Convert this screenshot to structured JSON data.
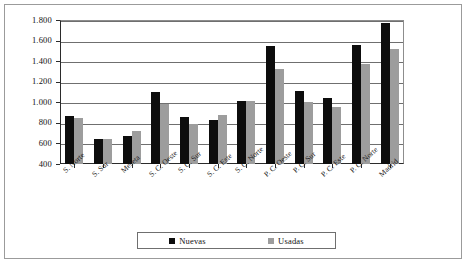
{
  "chart_data": {
    "type": "bar",
    "title": "",
    "subtitle": "",
    "xlabel": "",
    "ylabel": "",
    "ylim": [
      400,
      1800
    ],
    "ytick_step": 200,
    "ytick_labels": [
      "1.800",
      "1.600",
      "1.400",
      "1.200",
      "1.000",
      "800",
      "600",
      "400"
    ],
    "ytick_values": [
      1800,
      1600,
      1400,
      1200,
      1000,
      800,
      600,
      400
    ],
    "grid": true,
    "legend_position": "bottom",
    "categories": [
      "S. Norte",
      "S. Sur",
      "Meseta",
      "S. C. Oeste",
      "S. C. Sur",
      "S. C. Este",
      "S. C. Norte",
      "P. C. Oeste",
      "P. C. Sur",
      "P. C. Este",
      "P. C. Norte",
      "Madrid"
    ],
    "series": [
      {
        "name": "Nuevas",
        "color": "#0d0d0d",
        "values": [
          870,
          640,
          675,
          1105,
          855,
          825,
          1010,
          1550,
          1110,
          1040,
          1555,
          1775
        ]
      },
      {
        "name": "Usadas",
        "color": "#9d9d9d",
        "values": [
          850,
          640,
          720,
          980,
          790,
          880,
          1010,
          1320,
          1005,
          955,
          1375,
          1520
        ]
      }
    ]
  },
  "legend": {
    "items": [
      {
        "label": "Nuevas",
        "color": "#0d0d0d"
      },
      {
        "label": "Usadas",
        "color": "#9d9d9d"
      }
    ]
  }
}
